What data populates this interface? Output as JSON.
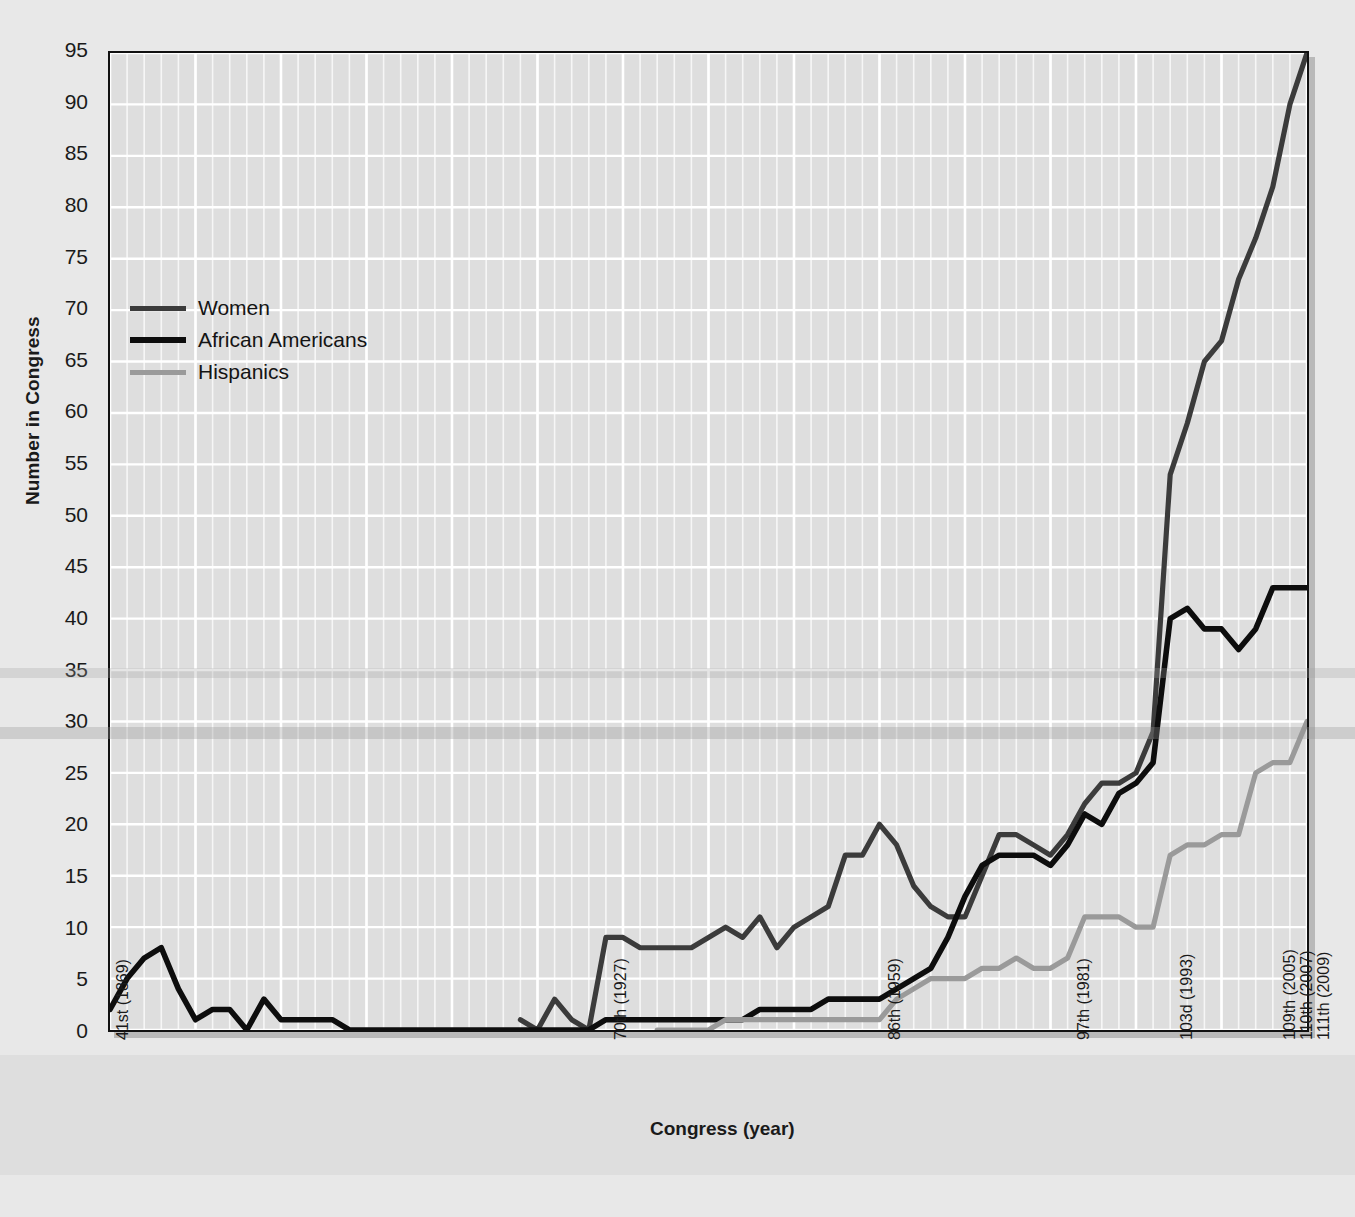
{
  "figure": {
    "background_color": "#e8e8e8",
    "plot_background_color": "#dedede",
    "grid_color": "#ffffff",
    "axis_color": "#111111"
  },
  "legend": {
    "position": "upper-left-inside",
    "entries": [
      {
        "label": "Women",
        "color": "#3b3b3b"
      },
      {
        "label": "African Americans",
        "color": "#0d0d0d"
      },
      {
        "label": "Hispanics",
        "color": "#9a9a9a"
      }
    ]
  },
  "chart_data": {
    "type": "line",
    "title": "",
    "xlabel": "Congress (year)",
    "ylabel": "Number in Congress",
    "ylim": [
      0,
      95
    ],
    "ytick_labels": [
      "0",
      "5",
      "10",
      "15",
      "20",
      "25",
      "30",
      "35",
      "40",
      "45",
      "50",
      "55",
      "60",
      "65",
      "70",
      "75",
      "80",
      "85",
      "90",
      "95"
    ],
    "ytick_values": [
      0,
      5,
      10,
      15,
      20,
      25,
      30,
      35,
      40,
      45,
      50,
      55,
      60,
      65,
      70,
      75,
      80,
      85,
      90,
      95
    ],
    "grid": true,
    "xtick_labels": [
      "41st (1869)",
      "70th (1927)",
      "86th (1959)",
      "97th (1981)",
      "103d (1993)",
      "109th (2005)",
      "110th (2007)",
      "111th (2009)"
    ],
    "xtick_congress": [
      41,
      70,
      86,
      97,
      103,
      109,
      110,
      111
    ],
    "x_range_congress": [
      41,
      111
    ],
    "x": [
      41,
      42,
      43,
      44,
      45,
      46,
      47,
      48,
      49,
      50,
      51,
      52,
      53,
      54,
      55,
      56,
      57,
      58,
      59,
      60,
      61,
      62,
      63,
      64,
      65,
      66,
      67,
      68,
      69,
      70,
      71,
      72,
      73,
      74,
      75,
      76,
      77,
      78,
      79,
      80,
      81,
      82,
      83,
      84,
      85,
      86,
      87,
      88,
      89,
      90,
      91,
      92,
      93,
      94,
      95,
      96,
      97,
      98,
      99,
      100,
      101,
      102,
      103,
      104,
      105,
      106,
      107,
      108,
      109,
      110,
      111
    ],
    "series": [
      {
        "name": "Women",
        "color": "#3b3b3b",
        "values": [
          null,
          null,
          null,
          null,
          null,
          null,
          null,
          null,
          null,
          null,
          null,
          null,
          null,
          null,
          null,
          null,
          null,
          null,
          null,
          null,
          null,
          null,
          null,
          null,
          1,
          0,
          3,
          1,
          0,
          9,
          9,
          8,
          8,
          8,
          8,
          9,
          10,
          9,
          11,
          8,
          10,
          11,
          12,
          17,
          17,
          20,
          18,
          14,
          12,
          11,
          11,
          15,
          19,
          19,
          18,
          17,
          19,
          22,
          24,
          24,
          25,
          29,
          54,
          59,
          65,
          67,
          73,
          77,
          82,
          90,
          95
        ]
      },
      {
        "name": "African Americans",
        "color": "#0d0d0d",
        "values": [
          2,
          5,
          7,
          8,
          4,
          1,
          2,
          2,
          0,
          3,
          1,
          1,
          1,
          1,
          0,
          0,
          0,
          0,
          0,
          0,
          0,
          0,
          0,
          0,
          0,
          0,
          0,
          0,
          0,
          1,
          1,
          1,
          1,
          1,
          1,
          1,
          1,
          1,
          2,
          2,
          2,
          2,
          3,
          3,
          3,
          3,
          4,
          5,
          6,
          9,
          13,
          16,
          17,
          17,
          17,
          16,
          18,
          21,
          20,
          23,
          24,
          26,
          40,
          41,
          39,
          39,
          37,
          39,
          43,
          43,
          43
        ]
      },
      {
        "name": "Hispanics",
        "color": "#9a9a9a",
        "values": [
          null,
          null,
          null,
          null,
          null,
          null,
          null,
          null,
          null,
          null,
          null,
          null,
          null,
          null,
          null,
          null,
          null,
          null,
          null,
          null,
          null,
          null,
          null,
          null,
          null,
          null,
          null,
          null,
          null,
          null,
          null,
          null,
          0,
          0,
          0,
          0,
          1,
          1,
          1,
          1,
          1,
          1,
          1,
          1,
          1,
          1,
          3,
          4,
          5,
          5,
          5,
          6,
          6,
          7,
          6,
          6,
          7,
          11,
          11,
          11,
          10,
          10,
          17,
          18,
          18,
          19,
          19,
          25,
          26,
          26,
          30
        ]
      }
    ]
  }
}
